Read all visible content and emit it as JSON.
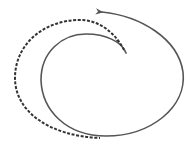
{
  "diagram": {
    "type": "spiral-arrows",
    "colors": {
      "background": "#ffffff",
      "solid_stroke": "#555555",
      "dashed_stroke": "#333333"
    },
    "paths": [
      {
        "name": "solid-spiral",
        "style": "solid",
        "has_arrowhead": true
      },
      {
        "name": "dashed-spiral",
        "style": "dashed",
        "has_arrowhead": false
      }
    ]
  }
}
